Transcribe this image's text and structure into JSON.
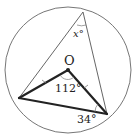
{
  "diagram": {
    "type": "circle-geometry",
    "circle": {
      "cx": 68,
      "cy": 70,
      "r": 63
    },
    "points": {
      "center": {
        "label": "O",
        "x": 68,
        "y": 70
      },
      "top": {
        "x": 83,
        "y": 12
      },
      "left": {
        "x": 19,
        "y": 98
      },
      "right": {
        "x": 107,
        "y": 114
      }
    },
    "labels": {
      "center": "O",
      "inscribed_angle": "x°",
      "central_angle": "112°",
      "base_angle": "34°"
    },
    "colors": {
      "stroke": "#222222",
      "thin_stroke": "#555555",
      "background": "#ffffff"
    }
  }
}
